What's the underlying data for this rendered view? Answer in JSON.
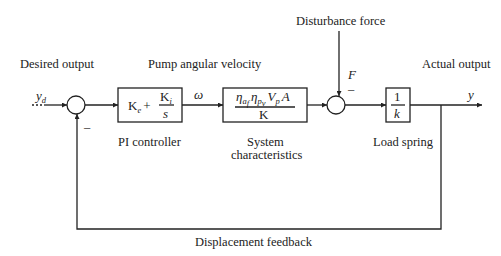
{
  "labels": {
    "desired_output": "Desired output",
    "pump_angular_velocity": "Pump angular velocity",
    "disturbance_force": "Disturbance force",
    "actual_output": "Actual output",
    "pi_controller": "PI controller",
    "system_line1": "System",
    "system_line2": "characteristics",
    "load_spring": "Load spring",
    "displacement_feedback": "Displacement feedback"
  },
  "signals": {
    "input": "y",
    "input_sub": "d",
    "omega": "ω",
    "force": "F",
    "output": "y",
    "minus_feedback": "–",
    "minus_disturbance": "–"
  },
  "blocks": {
    "pi": {
      "kp": "K",
      "kp_sub": "e",
      "plus": "+",
      "ki_num": "K",
      "ki_sub": "i",
      "ki_den": "s"
    },
    "system": {
      "eta1": "η",
      "eta1_sub": "a",
      "eta1_subsub": "f",
      "eta2": "η",
      "eta2_sub": "p",
      "eta2_subsub": "v",
      "vp": "V",
      "vp_sub": "p",
      "a": "A",
      "den": "K"
    },
    "spring": {
      "num": "1",
      "den": "k"
    }
  }
}
